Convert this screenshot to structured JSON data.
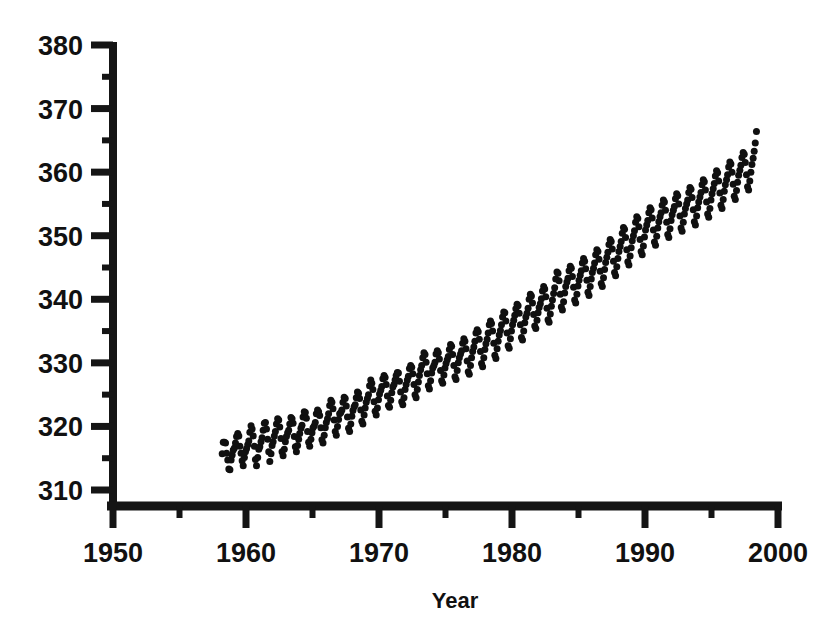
{
  "chart_data": {
    "type": "scatter",
    "title": "",
    "subtitle": "",
    "xlabel": "Year",
    "ylabel": "",
    "xlim": [
      1948.0,
      2000.5
    ],
    "ylim": [
      307.0,
      381.5
    ],
    "grid": false,
    "legend": null,
    "marker": "filled-circle",
    "marker_color": "#101010",
    "marker_size_px": 7,
    "background_color": "#ffffff",
    "axis_color": "#151515",
    "x_ticks_major": [
      1950,
      1960,
      1970,
      1980,
      1990,
      2000
    ],
    "x_tick_labels": [
      "1950",
      "1960",
      "1970",
      "1980",
      "1990",
      "2000"
    ],
    "x_ticks_minor": [
      1955,
      1965,
      1975,
      1985,
      1995
    ],
    "y_ticks_major": [
      310,
      320,
      330,
      340,
      350,
      360,
      370,
      380
    ],
    "y_tick_labels": [
      "310",
      "320",
      "330",
      "340",
      "350",
      "360",
      "370",
      "380"
    ],
    "y_ticks_minor": [
      315,
      325,
      335,
      345,
      355,
      365,
      375
    ],
    "series_name": "Monthly mean CO2 concentration",
    "x_start": 1958.2,
    "x_end": 1998.4,
    "annotations": [],
    "x": [
      1958.21,
      1958.29,
      1958.38,
      1958.46,
      1958.54,
      1958.63,
      1958.71,
      1958.79,
      1958.88,
      1958.96,
      1959.04,
      1959.13,
      1959.21,
      1959.29,
      1959.38,
      1959.46,
      1959.54,
      1959.63,
      1959.71,
      1959.79,
      1959.88,
      1959.96,
      1960.04,
      1960.13,
      1960.21,
      1960.29,
      1960.38,
      1960.46,
      1960.54,
      1960.63,
      1960.71,
      1960.79,
      1960.88,
      1960.96,
      1961.04,
      1961.13,
      1961.21,
      1961.29,
      1961.38,
      1961.46,
      1961.54,
      1961.63,
      1961.71,
      1961.79,
      1961.88,
      1961.96,
      1962.04,
      1962.13,
      1962.21,
      1962.29,
      1962.38,
      1962.46,
      1962.54,
      1962.63,
      1962.71,
      1962.79,
      1962.88,
      1962.96,
      1963.04,
      1963.13,
      1963.21,
      1963.29,
      1963.38,
      1963.46,
      1963.54,
      1963.63,
      1963.71,
      1963.79,
      1963.88,
      1963.96,
      1964.04,
      1964.13,
      1964.21,
      1964.29,
      1964.38,
      1964.46,
      1964.54,
      1964.63,
      1964.71,
      1964.79,
      1964.88,
      1964.96,
      1965.04,
      1965.13,
      1965.21,
      1965.29,
      1965.38,
      1965.46,
      1965.54,
      1965.63,
      1965.71,
      1965.79,
      1965.88,
      1965.96,
      1966.04,
      1966.13,
      1966.21,
      1966.29,
      1966.38,
      1966.46,
      1966.54,
      1966.63,
      1966.71,
      1966.79,
      1966.88,
      1966.96,
      1967.04,
      1967.13,
      1967.21,
      1967.29,
      1967.38,
      1967.46,
      1967.54,
      1967.63,
      1967.71,
      1967.79,
      1967.88,
      1967.96,
      1968.04,
      1968.13,
      1968.21,
      1968.29,
      1968.38,
      1968.46,
      1968.54,
      1968.63,
      1968.71,
      1968.79,
      1968.88,
      1968.96,
      1969.04,
      1969.13,
      1969.21,
      1969.29,
      1969.38,
      1969.46,
      1969.54,
      1969.63,
      1969.71,
      1969.79,
      1969.88,
      1969.96,
      1970.04,
      1970.13,
      1970.21,
      1970.29,
      1970.38,
      1970.46,
      1970.54,
      1970.63,
      1970.71,
      1970.79,
      1970.88,
      1970.96,
      1971.04,
      1971.13,
      1971.21,
      1971.29,
      1971.38,
      1971.46,
      1971.54,
      1971.63,
      1971.71,
      1971.79,
      1971.88,
      1971.96,
      1972.04,
      1972.13,
      1972.21,
      1972.29,
      1972.38,
      1972.46,
      1972.54,
      1972.63,
      1972.71,
      1972.79,
      1972.88,
      1972.96,
      1973.04,
      1973.13,
      1973.21,
      1973.29,
      1973.38,
      1973.46,
      1973.54,
      1973.63,
      1973.71,
      1973.79,
      1973.88,
      1973.96,
      1974.04,
      1974.13,
      1974.21,
      1974.29,
      1974.38,
      1974.46,
      1974.54,
      1974.63,
      1974.71,
      1974.79,
      1974.88,
      1974.96,
      1975.04,
      1975.13,
      1975.21,
      1975.29,
      1975.38,
      1975.46,
      1975.54,
      1975.63,
      1975.71,
      1975.79,
      1975.88,
      1975.96,
      1976.04,
      1976.13,
      1976.21,
      1976.29,
      1976.38,
      1976.46,
      1976.54,
      1976.63,
      1976.71,
      1976.79,
      1976.88,
      1976.96,
      1977.04,
      1977.13,
      1977.21,
      1977.29,
      1977.38,
      1977.46,
      1977.54,
      1977.63,
      1977.71,
      1977.79,
      1977.88,
      1977.96,
      1978.04,
      1978.13,
      1978.21,
      1978.29,
      1978.38,
      1978.46,
      1978.54,
      1978.63,
      1978.71,
      1978.79,
      1978.88,
      1978.96,
      1979.04,
      1979.13,
      1979.21,
      1979.29,
      1979.38,
      1979.46,
      1979.54,
      1979.63,
      1979.71,
      1979.79,
      1979.88,
      1979.96,
      1980.04,
      1980.13,
      1980.21,
      1980.29,
      1980.38,
      1980.46,
      1980.54,
      1980.63,
      1980.71,
      1980.79,
      1980.88,
      1980.96,
      1981.04,
      1981.13,
      1981.21,
      1981.29,
      1981.38,
      1981.46,
      1981.54,
      1981.63,
      1981.71,
      1981.79,
      1981.88,
      1981.96,
      1982.04,
      1982.13,
      1982.21,
      1982.29,
      1982.38,
      1982.46,
      1982.54,
      1982.63,
      1982.71,
      1982.79,
      1982.88,
      1982.96,
      1983.04,
      1983.13,
      1983.21,
      1983.29,
      1983.38,
      1983.46,
      1983.54,
      1983.63,
      1983.71,
      1983.79,
      1983.88,
      1983.96,
      1984.04,
      1984.13,
      1984.21,
      1984.29,
      1984.38,
      1984.46,
      1984.54,
      1984.63,
      1984.71,
      1984.79,
      1984.88,
      1984.96,
      1985.04,
      1985.13,
      1985.21,
      1985.29,
      1985.38,
      1985.46,
      1985.54,
      1985.63,
      1985.71,
      1985.79,
      1985.88,
      1985.96,
      1986.04,
      1986.13,
      1986.21,
      1986.29,
      1986.38,
      1986.46,
      1986.54,
      1986.63,
      1986.71,
      1986.79,
      1986.88,
      1986.96,
      1987.04,
      1987.13,
      1987.21,
      1987.29,
      1987.38,
      1987.46,
      1987.54,
      1987.63,
      1987.71,
      1987.79,
      1987.88,
      1987.96,
      1988.04,
      1988.13,
      1988.21,
      1988.29,
      1988.38,
      1988.46,
      1988.54,
      1988.63,
      1988.71,
      1988.79,
      1988.88,
      1988.96,
      1989.04,
      1989.13,
      1989.21,
      1989.29,
      1989.38,
      1989.46,
      1989.54,
      1989.63,
      1989.71,
      1989.79,
      1989.88,
      1989.96,
      1990.04,
      1990.13,
      1990.21,
      1990.29,
      1990.38,
      1990.46,
      1990.54,
      1990.63,
      1990.71,
      1990.79,
      1990.88,
      1990.96,
      1991.04,
      1991.13,
      1991.21,
      1991.29,
      1991.38,
      1991.46,
      1991.54,
      1991.63,
      1991.71,
      1991.79,
      1991.88,
      1991.96,
      1992.04,
      1992.13,
      1992.21,
      1992.29,
      1992.38,
      1992.46,
      1992.54,
      1992.63,
      1992.71,
      1992.79,
      1992.88,
      1992.96,
      1993.04,
      1993.13,
      1993.21,
      1993.29,
      1993.38,
      1993.46,
      1993.54,
      1993.63,
      1993.71,
      1993.79,
      1993.88,
      1993.96,
      1994.04,
      1994.13,
      1994.21,
      1994.29,
      1994.38,
      1994.46,
      1994.54,
      1994.63,
      1994.71,
      1994.79,
      1994.88,
      1994.96,
      1995.04,
      1995.13,
      1995.21,
      1995.29,
      1995.38,
      1995.46,
      1995.54,
      1995.63,
      1995.71,
      1995.79,
      1995.88,
      1995.96,
      1996.04,
      1996.13,
      1996.21,
      1996.29,
      1996.38,
      1996.46,
      1996.54,
      1996.63,
      1996.71,
      1996.79,
      1996.88,
      1996.96,
      1997.04,
      1997.13,
      1997.21,
      1997.29,
      1997.38,
      1997.46,
      1997.54,
      1997.63,
      1997.71,
      1997.79,
      1997.88,
      1997.96,
      1998.04,
      1998.13,
      1998.21,
      1998.29,
      1998.38
    ],
    "y": [
      315.7,
      317.5,
      317.5,
      317.4,
      315.8,
      314.7,
      313.3,
      313.2,
      314.7,
      315.5,
      316.3,
      316.6,
      317.4,
      318.4,
      318.9,
      318.5,
      316.9,
      315.8,
      314.6,
      313.8,
      315.1,
      316.0,
      316.5,
      317.1,
      317.7,
      319.1,
      320.1,
      319.6,
      318.5,
      316.9,
      314.8,
      313.8,
      315.1,
      316.4,
      316.8,
      317.6,
      318.2,
      319.4,
      320.5,
      320.6,
      319.6,
      318.0,
      316.0,
      314.5,
      315.7,
      317.0,
      317.6,
      318.5,
      319.2,
      320.4,
      321.2,
      321.0,
      319.9,
      318.1,
      316.0,
      315.4,
      316.4,
      317.6,
      318.4,
      319.0,
      319.4,
      320.4,
      321.4,
      321.2,
      320.5,
      318.4,
      316.8,
      316.0,
      317.0,
      318.0,
      318.9,
      319.7,
      320.2,
      321.5,
      322.3,
      322.2,
      321.3,
      319.2,
      317.5,
      316.9,
      318.0,
      319.0,
      319.8,
      320.1,
      320.6,
      322.0,
      322.6,
      322.3,
      321.7,
      319.8,
      317.9,
      317.4,
      318.6,
      319.8,
      320.6,
      321.2,
      322.0,
      323.3,
      324.1,
      323.8,
      322.8,
      321.0,
      319.2,
      318.6,
      320.0,
      321.1,
      322.0,
      322.2,
      322.6,
      323.8,
      324.6,
      324.4,
      323.2,
      321.5,
      319.7,
      319.2,
      320.4,
      321.6,
      322.5,
      323.1,
      323.4,
      324.5,
      325.4,
      325.2,
      324.4,
      322.6,
      320.8,
      320.4,
      321.8,
      322.9,
      323.8,
      324.4,
      325.0,
      326.4,
      327.3,
      326.8,
      325.8,
      323.9,
      322.4,
      321.8,
      322.9,
      324.2,
      325.1,
      325.7,
      326.3,
      327.5,
      328.0,
      327.7,
      326.6,
      324.8,
      323.3,
      323.0,
      324.1,
      325.3,
      326.2,
      326.6,
      327.3,
      328.0,
      328.5,
      328.4,
      327.1,
      325.4,
      323.9,
      323.4,
      324.5,
      325.8,
      326.6,
      327.3,
      327.9,
      329.1,
      329.6,
      329.3,
      328.3,
      326.6,
      325.0,
      324.5,
      325.8,
      327.0,
      328.0,
      328.9,
      329.6,
      330.8,
      331.6,
      331.3,
      330.1,
      328.3,
      326.4,
      325.9,
      327.2,
      328.4,
      329.2,
      329.6,
      330.1,
      331.4,
      331.9,
      331.6,
      330.6,
      328.8,
      327.2,
      326.8,
      328.1,
      329.2,
      329.9,
      330.5,
      331.0,
      332.1,
      332.9,
      332.6,
      331.3,
      329.6,
      327.8,
      327.4,
      328.8,
      330.0,
      330.8,
      331.4,
      331.9,
      333.1,
      333.8,
      333.4,
      332.2,
      330.3,
      328.6,
      328.2,
      329.6,
      330.8,
      331.8,
      332.5,
      333.4,
      334.7,
      335.2,
      334.9,
      333.7,
      331.8,
      329.9,
      329.4,
      330.8,
      332.1,
      333.0,
      333.7,
      334.7,
      336.0,
      336.6,
      336.2,
      335.0,
      333.1,
      331.2,
      330.7,
      332.2,
      333.4,
      334.4,
      335.1,
      336.0,
      337.2,
      338.0,
      337.9,
      336.6,
      334.7,
      332.7,
      332.3,
      333.8,
      335.0,
      336.0,
      336.7,
      337.5,
      338.5,
      339.2,
      339.0,
      337.8,
      336.0,
      334.0,
      333.6,
      335.0,
      336.3,
      337.2,
      337.8,
      338.6,
      340.0,
      340.8,
      340.5,
      339.4,
      337.6,
      335.8,
      335.4,
      336.7,
      337.9,
      338.7,
      339.3,
      340.1,
      341.3,
      342.0,
      341.6,
      340.4,
      338.6,
      336.8,
      336.4,
      337.7,
      338.9,
      339.9,
      340.9,
      341.8,
      343.2,
      344.3,
      344.1,
      342.9,
      340.8,
      338.8,
      338.3,
      339.6,
      341.0,
      342.0,
      342.7,
      343.3,
      344.5,
      345.2,
      344.9,
      343.6,
      341.9,
      339.9,
      339.4,
      340.8,
      342.1,
      343.0,
      343.8,
      344.5,
      345.7,
      346.4,
      346.0,
      344.8,
      343.0,
      341.1,
      340.6,
      342.0,
      343.2,
      344.2,
      344.9,
      345.7,
      347.0,
      347.8,
      347.5,
      346.3,
      344.4,
      342.5,
      342.0,
      343.4,
      344.7,
      345.8,
      346.6,
      347.4,
      348.6,
      349.4,
      349.1,
      347.9,
      346.0,
      344.2,
      343.7,
      345.1,
      346.4,
      347.5,
      348.3,
      349.1,
      350.4,
      351.3,
      351.0,
      349.7,
      347.8,
      345.9,
      345.4,
      346.8,
      348.1,
      349.2,
      350.0,
      350.8,
      352.1,
      353.0,
      352.7,
      351.4,
      349.4,
      347.5,
      347.0,
      348.4,
      349.8,
      350.9,
      351.7,
      352.4,
      353.6,
      354.4,
      354.1,
      352.8,
      350.9,
      349.0,
      348.5,
      349.9,
      351.2,
      352.2,
      353.0,
      353.6,
      354.8,
      355.6,
      355.3,
      354.0,
      352.1,
      350.2,
      349.7,
      351.1,
      352.4,
      353.3,
      354.0,
      354.6,
      355.8,
      356.6,
      356.3,
      355.0,
      353.1,
      351.2,
      350.7,
      352.1,
      353.4,
      354.3,
      355.0,
      355.6,
      356.8,
      357.6,
      357.3,
      356.0,
      354.1,
      352.2,
      351.7,
      353.1,
      354.4,
      355.3,
      356.1,
      356.8,
      358.0,
      358.8,
      358.5,
      357.2,
      355.3,
      353.4,
      352.9,
      354.3,
      355.6,
      356.6,
      357.4,
      358.2,
      359.4,
      360.2,
      359.9,
      358.6,
      356.7,
      354.8,
      354.3,
      355.7,
      357.0,
      358.0,
      358.8,
      359.6,
      360.8,
      361.6,
      361.3,
      360.0,
      358.1,
      356.2,
      355.7,
      357.1,
      358.4,
      359.5,
      360.3,
      361.1,
      362.3,
      363.1,
      362.8,
      361.5,
      359.6,
      357.7,
      357.2,
      358.6,
      360.0,
      361.2,
      362.2,
      363.3,
      364.6,
      366.4
    ]
  }
}
